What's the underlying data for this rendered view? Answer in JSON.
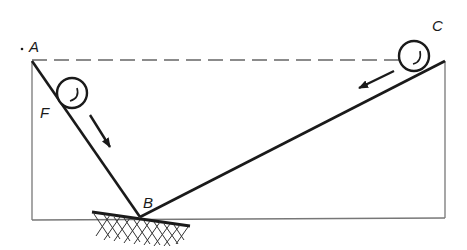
{
  "diagram": {
    "type": "physics-inclined-planes",
    "labels": {
      "A": "A",
      "B": "B",
      "C": "C",
      "F": "F"
    },
    "points": {
      "A": [
        32,
        61
      ],
      "B": [
        140,
        217
      ],
      "C": [
        445,
        61
      ]
    },
    "balls": [
      {
        "name": "ball-F",
        "cx": 72,
        "cy": 93,
        "r": 15
      },
      {
        "name": "ball-C",
        "cx": 414,
        "cy": 56,
        "r": 15
      }
    ],
    "colors": {
      "ink": "#1a1a1a",
      "frame": "#777777",
      "dash": "#666666"
    }
  }
}
